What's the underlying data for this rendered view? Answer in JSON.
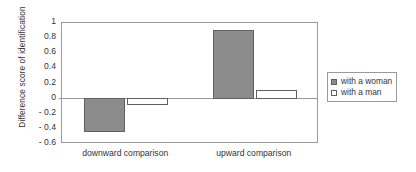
{
  "chart_data": {
    "type": "bar",
    "title": "",
    "xlabel": "",
    "ylabel": "Difference score of identification",
    "categories": [
      "downward comparison",
      "upward comparison"
    ],
    "series": [
      {
        "name": "with a woman",
        "values": [
          -0.44,
          0.89
        ],
        "swatch": "filled",
        "color": "#8c8c8c"
      },
      {
        "name": "with a man",
        "values": [
          -0.08,
          0.1
        ],
        "swatch": "hollow",
        "color": "#ffffff"
      }
    ],
    "ylim": [
      -0.6,
      1
    ],
    "ytick_values": [
      1,
      0.8,
      0.6,
      0.4,
      0.2,
      0,
      -0.2,
      -0.4,
      -0.6
    ],
    "ytick_labels": [
      "1",
      "0.8",
      "0.6",
      "0.4",
      "0.2",
      "0",
      "- 0.2",
      "- 0.4",
      "- 0.6"
    ],
    "grid": false,
    "legend_position": "right",
    "zero_line": true,
    "frame": true
  },
  "legend": {
    "entries": [
      {
        "label": "with a woman"
      },
      {
        "label": "with a man"
      }
    ]
  },
  "colors": {
    "bar_fill": "#8c8c8c",
    "bar_edge": "#5f5f5f",
    "axis": "#9a9a9a",
    "text": "#333333",
    "background": "#ffffff"
  }
}
